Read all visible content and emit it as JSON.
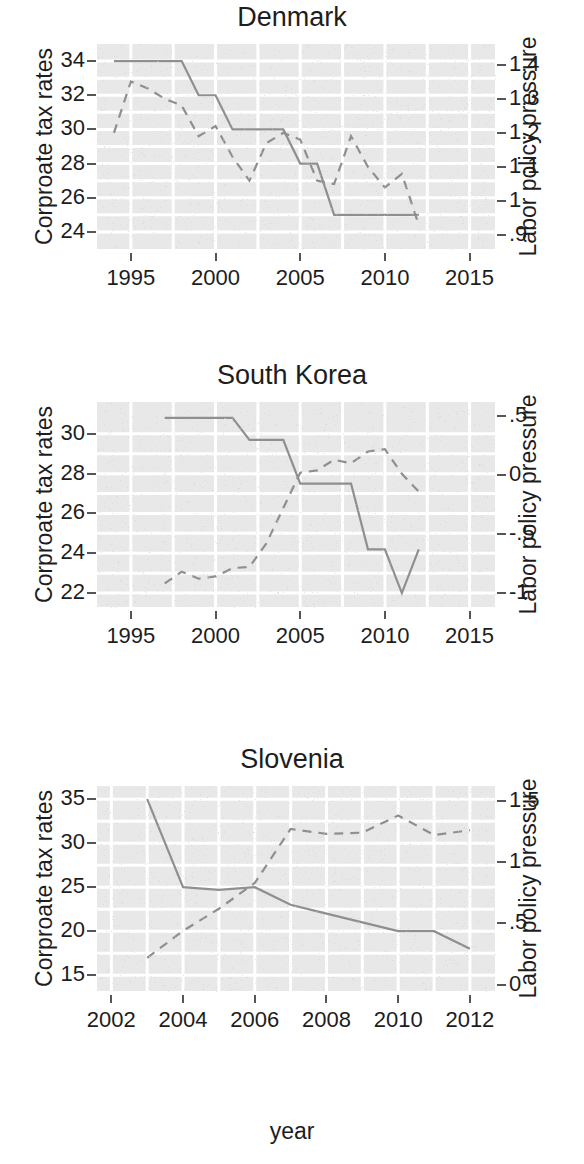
{
  "figure": {
    "x_axis_title": "year",
    "y_axis_label_left": "Corproate tax rates",
    "y_axis_label_right": "Labor policy pressure"
  },
  "chart_data": [
    {
      "type": "line",
      "title": "Denmark",
      "xlabel": "",
      "ylabel": "Corproate tax rates",
      "ylabel_right": "Labor policy pressure",
      "xlim": [
        1993,
        2016.5
      ],
      "ylim": [
        23.0,
        35.0
      ],
      "ylim_right": [
        0.86,
        1.46
      ],
      "xticks": [
        "1995",
        "2000",
        "2005",
        "2010",
        "2015"
      ],
      "xtick_values": [
        1995,
        2000,
        2005,
        2010,
        2015
      ],
      "yticks_left": [
        "34",
        "32",
        "30",
        "28",
        "26",
        "24"
      ],
      "ytick_values_left": [
        34,
        32,
        30,
        28,
        26,
        24
      ],
      "yticks_right": [
        "1.4",
        "1.3",
        "1.2",
        "1.1",
        "1",
        ".9"
      ],
      "ytick_values_right": [
        1.4,
        1.3,
        1.2,
        1.1,
        1.0,
        0.9
      ],
      "grid": true,
      "legend": "none",
      "series": [
        {
          "name": "Corporate tax rate",
          "axis": "left",
          "style": "solid",
          "x": [
            1994,
            1995,
            1996,
            1997,
            1998,
            1999,
            2000,
            2001,
            2002,
            2003,
            2004,
            2005,
            2006,
            2007,
            2008,
            2009,
            2010,
            2011,
            2012
          ],
          "values": [
            34,
            34,
            34,
            34,
            34,
            32,
            32,
            30,
            30,
            30,
            30,
            28,
            28,
            25,
            25,
            25,
            25,
            25,
            25
          ]
        },
        {
          "name": "Labor policy pressure",
          "axis": "right",
          "style": "dashed",
          "x": [
            1994,
            1995,
            1996,
            1997,
            1998,
            1999,
            2000,
            2001,
            2002,
            2003,
            2004,
            2005,
            2006,
            2007,
            2008,
            2009,
            2010,
            2011,
            2012
          ],
          "values": [
            1.2,
            1.35,
            1.33,
            1.3,
            1.28,
            1.19,
            1.22,
            1.13,
            1.06,
            1.17,
            1.2,
            1.18,
            1.06,
            1.05,
            1.19,
            1.1,
            1.04,
            1.08,
            0.93
          ]
        }
      ]
    },
    {
      "type": "line",
      "title": "South Korea",
      "xlabel": "",
      "ylabel": "Corproate tax rates",
      "ylabel_right": "Labor policy pressure",
      "xlim": [
        1993,
        2016.5
      ],
      "ylim": [
        21.3,
        31.6
      ],
      "ylim_right": [
        -1.12,
        0.62
      ],
      "xticks": [
        "1995",
        "2000",
        "2005",
        "2010",
        "2015"
      ],
      "xtick_values": [
        1995,
        2000,
        2005,
        2010,
        2015
      ],
      "yticks_left": [
        "30",
        "28",
        "26",
        "24",
        "22"
      ],
      "ytick_values_left": [
        30,
        28,
        26,
        24,
        22
      ],
      "yticks_right": [
        ".5",
        "0",
        "-.5",
        "-1"
      ],
      "ytick_values_right": [
        0.5,
        0,
        -0.5,
        -1
      ],
      "grid": true,
      "legend": "none",
      "series": [
        {
          "name": "Corporate tax rate",
          "axis": "left",
          "style": "solid",
          "x": [
            1997,
            1998,
            1999,
            2000,
            2001,
            2002,
            2003,
            2004,
            2005,
            2006,
            2007,
            2008,
            2009,
            2010,
            2011,
            2012
          ],
          "values": [
            30.8,
            30.8,
            30.8,
            30.8,
            30.8,
            29.7,
            29.7,
            29.7,
            27.5,
            27.5,
            27.5,
            27.5,
            24.2,
            24.2,
            22.0,
            24.2
          ]
        },
        {
          "name": "Labor policy pressure",
          "axis": "right",
          "style": "dashed",
          "x": [
            1997,
            1998,
            1999,
            2000,
            2001,
            2002,
            2003,
            2004,
            2005,
            2006,
            2007,
            2008,
            2009,
            2010,
            2011,
            2012
          ],
          "values": [
            -0.92,
            -0.82,
            -0.88,
            -0.86,
            -0.79,
            -0.78,
            -0.58,
            -0.28,
            0.02,
            0.04,
            0.13,
            0.1,
            0.2,
            0.22,
            0.01,
            -0.14
          ]
        }
      ]
    },
    {
      "type": "line",
      "title": "Slovenia",
      "xlabel": "year",
      "ylabel": "Corproate tax rates",
      "ylabel_right": "Labor policy pressure",
      "xlim": [
        2001.6,
        2012.7
      ],
      "ylim": [
        13.2,
        36.5
      ],
      "ylim_right": [
        -0.05,
        1.62
      ],
      "xticks": [
        "2002",
        "2004",
        "2006",
        "2008",
        "2010",
        "2012"
      ],
      "xtick_values": [
        2002,
        2004,
        2006,
        2008,
        2010,
        2012
      ],
      "yticks_left": [
        "35",
        "30",
        "25",
        "20",
        "15"
      ],
      "ytick_values_left": [
        35,
        30,
        25,
        20,
        15
      ],
      "yticks_right": [
        "1.5",
        "1",
        ".5",
        "0"
      ],
      "ytick_values_right": [
        1.5,
        1.0,
        0.5,
        0
      ],
      "grid": true,
      "legend": "none",
      "series": [
        {
          "name": "Corporate tax rate",
          "axis": "left",
          "style": "solid",
          "x": [
            2003,
            2004,
            2005,
            2006,
            2007,
            2008,
            2009,
            2010,
            2011,
            2012
          ],
          "values": [
            35,
            25,
            24.7,
            25,
            23,
            22,
            21,
            20,
            20,
            18
          ]
        },
        {
          "name": "Labor policy pressure",
          "axis": "right",
          "style": "dashed",
          "x": [
            2003,
            2004,
            2005,
            2006,
            2007,
            2008,
            2009,
            2010,
            2011,
            2012
          ],
          "values": [
            0.22,
            0.44,
            0.62,
            0.83,
            1.27,
            1.23,
            1.24,
            1.38,
            1.22,
            1.26
          ]
        }
      ]
    }
  ]
}
